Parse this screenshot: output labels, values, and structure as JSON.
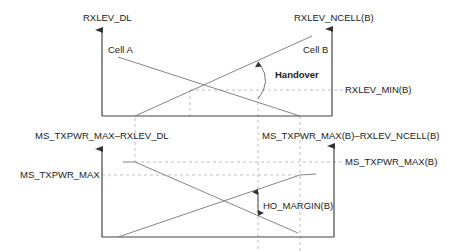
{
  "top_panel": {
    "y_axis_left_label": "RXLEV_DL",
    "y_axis_right_label": "RXLEV_NCELL(B)",
    "curve_a_label": "Cell A",
    "curve_b_label": "Cell B",
    "event_label": "Handover",
    "threshold_label": "RXLEV_MIN(B)"
  },
  "bottom_panel": {
    "y_axis_left_label": "MS_TXPWR_MAX–RXLEV_DL",
    "y_axis_right_label": "MS_TXPWR_MAX(B)–RXLEV_NCELL(B)",
    "level_left_label": "MS_TXPWR_MAX",
    "level_right_label": "MS_TXPWR_MAX(B)",
    "margin_label": "HO_MARGIN(B)"
  },
  "colors": {
    "line": "#666666",
    "axis": "#444444",
    "dash": "#aaaaaa",
    "text": "#222222"
  }
}
